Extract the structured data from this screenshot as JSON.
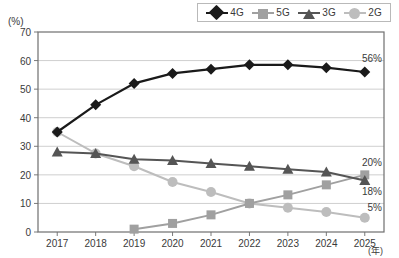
{
  "chart_data": {
    "type": "line",
    "title": "",
    "xlabel": "(年)",
    "ylabel": "(%)",
    "ylim": [
      0,
      70
    ],
    "ytick_step": 10,
    "yticks": [
      "0",
      "10",
      "20",
      "30",
      "40",
      "50",
      "60",
      "70"
    ],
    "categories": [
      "2017",
      "2018",
      "2019",
      "2020",
      "2021",
      "2022",
      "2023",
      "2024",
      "2025"
    ],
    "grid": true,
    "legend_position": "top-right",
    "series": [
      {
        "name": "4G",
        "color": "#1a1a1a",
        "marker": "diamond",
        "values": [
          35,
          44.5,
          52,
          55.5,
          57,
          58.5,
          58.5,
          57.5,
          56
        ],
        "end_label": "56%"
      },
      {
        "name": "5G",
        "color": "#a0a0a0",
        "marker": "square",
        "values": [
          null,
          null,
          1,
          3,
          6,
          10,
          13,
          16.5,
          20
        ],
        "end_label": "20%"
      },
      {
        "name": "3G",
        "color": "#555555",
        "marker": "triangle",
        "values": [
          28,
          27.5,
          25.5,
          25,
          24,
          23,
          22,
          21,
          18
        ],
        "end_label": "18%"
      },
      {
        "name": "2G",
        "color": "#bdbdbd",
        "marker": "circle",
        "values": [
          35,
          27.5,
          23,
          17.5,
          14,
          10,
          8.5,
          7,
          5
        ],
        "end_label": "5%"
      }
    ]
  },
  "legend": {
    "items": [
      {
        "label": "4G",
        "marker": "diamond-marker"
      },
      {
        "label": "5G",
        "marker": "square-marker"
      },
      {
        "label": "3G",
        "marker": "triangle-marker"
      },
      {
        "label": "2G",
        "marker": "circle-marker"
      }
    ]
  }
}
